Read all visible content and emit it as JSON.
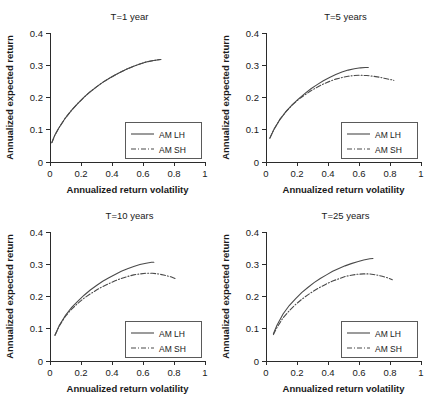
{
  "figure": {
    "layout": "2x2-grid-of-line-charts",
    "background_color": "#ffffff",
    "line_color": "#4a4a4a",
    "axis_color": "#2b2b2b"
  },
  "axis_titles": {
    "x": "Annualized return volatility",
    "y": "Annualized expected return"
  },
  "ticks": {
    "x_labels": [
      "0",
      "0.2",
      "0.4",
      "0.6",
      "0.8",
      "1"
    ],
    "x_values": [
      0,
      0.2,
      0.4,
      0.6,
      0.8,
      1
    ],
    "y_labels": [
      "0",
      "0.1",
      "0.2",
      "0.3",
      "0.4"
    ],
    "y_values": [
      0,
      0.1,
      0.2,
      0.3,
      0.4
    ]
  },
  "legend": {
    "entries": [
      {
        "label": "AM LH",
        "style": "solid"
      },
      {
        "label": "AM SH",
        "style": "dashdot"
      }
    ]
  },
  "chart_data": [
    {
      "type": "line",
      "title": "T=1 year",
      "xlabel": "Annualized return volatility",
      "ylabel": "Annualized expected return",
      "xlim": [
        0,
        1
      ],
      "ylim": [
        0,
        0.4
      ],
      "grid": false,
      "legend_position": "lower-right",
      "series": [
        {
          "name": "AM LH",
          "style": "solid",
          "x": [
            0.012,
            0.03,
            0.06,
            0.1,
            0.14,
            0.18,
            0.22,
            0.26,
            0.3,
            0.34,
            0.38,
            0.42,
            0.46,
            0.5,
            0.54,
            0.58,
            0.62,
            0.66,
            0.7,
            0.715
          ],
          "y": [
            0.06,
            0.082,
            0.108,
            0.137,
            0.161,
            0.182,
            0.201,
            0.218,
            0.233,
            0.247,
            0.259,
            0.27,
            0.28,
            0.289,
            0.297,
            0.304,
            0.31,
            0.314,
            0.317,
            0.318
          ]
        },
        {
          "name": "AM SH",
          "style": "dashdot",
          "x": [
            0.012,
            0.03,
            0.06,
            0.1,
            0.14,
            0.18,
            0.22,
            0.26,
            0.3,
            0.34,
            0.38,
            0.42,
            0.46,
            0.5,
            0.54,
            0.58,
            0.62,
            0.66,
            0.7,
            0.715
          ],
          "y": [
            0.06,
            0.082,
            0.108,
            0.137,
            0.161,
            0.182,
            0.201,
            0.218,
            0.233,
            0.247,
            0.259,
            0.27,
            0.28,
            0.289,
            0.297,
            0.304,
            0.31,
            0.314,
            0.317,
            0.318
          ]
        }
      ]
    },
    {
      "type": "line",
      "title": "T=5 years",
      "xlabel": "Annualized return volatility",
      "ylabel": "Annualized expected return",
      "xlim": [
        0,
        1
      ],
      "ylim": [
        0,
        0.4
      ],
      "grid": false,
      "legend_position": "lower-right",
      "series": [
        {
          "name": "AM LH",
          "style": "solid",
          "x": [
            0.025,
            0.05,
            0.09,
            0.13,
            0.17,
            0.21,
            0.25,
            0.29,
            0.33,
            0.37,
            0.41,
            0.45,
            0.49,
            0.53,
            0.57,
            0.61,
            0.64,
            0.66
          ],
          "y": [
            0.074,
            0.1,
            0.132,
            0.157,
            0.178,
            0.196,
            0.212,
            0.227,
            0.24,
            0.252,
            0.262,
            0.271,
            0.279,
            0.285,
            0.289,
            0.292,
            0.293,
            0.293
          ]
        },
        {
          "name": "AM SH",
          "style": "dashdot",
          "x": [
            0.025,
            0.05,
            0.09,
            0.13,
            0.17,
            0.21,
            0.25,
            0.29,
            0.33,
            0.37,
            0.41,
            0.45,
            0.49,
            0.53,
            0.57,
            0.61,
            0.65,
            0.69,
            0.73,
            0.77,
            0.81,
            0.825
          ],
          "y": [
            0.074,
            0.1,
            0.132,
            0.157,
            0.177,
            0.194,
            0.208,
            0.221,
            0.232,
            0.242,
            0.25,
            0.257,
            0.262,
            0.266,
            0.268,
            0.269,
            0.268,
            0.266,
            0.263,
            0.259,
            0.255,
            0.253
          ]
        }
      ]
    },
    {
      "type": "line",
      "title": "T=10 years",
      "xlabel": "Annualized return volatility",
      "ylabel": "Annualized expected return",
      "xlim": [
        0,
        1
      ],
      "ylim": [
        0,
        0.4
      ],
      "grid": false,
      "legend_position": "lower-right",
      "series": [
        {
          "name": "AM LH",
          "style": "solid",
          "x": [
            0.032,
            0.06,
            0.1,
            0.14,
            0.18,
            0.22,
            0.26,
            0.3,
            0.34,
            0.38,
            0.42,
            0.46,
            0.5,
            0.54,
            0.58,
            0.62,
            0.655,
            0.67
          ],
          "y": [
            0.08,
            0.11,
            0.142,
            0.166,
            0.186,
            0.204,
            0.22,
            0.234,
            0.247,
            0.258,
            0.268,
            0.278,
            0.286,
            0.293,
            0.299,
            0.303,
            0.306,
            0.306
          ]
        },
        {
          "name": "AM SH",
          "style": "dashdot",
          "x": [
            0.032,
            0.06,
            0.1,
            0.14,
            0.18,
            0.22,
            0.26,
            0.3,
            0.34,
            0.38,
            0.42,
            0.46,
            0.5,
            0.54,
            0.58,
            0.62,
            0.66,
            0.7,
            0.74,
            0.78,
            0.815
          ],
          "y": [
            0.08,
            0.109,
            0.139,
            0.161,
            0.179,
            0.195,
            0.208,
            0.22,
            0.231,
            0.24,
            0.249,
            0.256,
            0.262,
            0.267,
            0.27,
            0.272,
            0.272,
            0.27,
            0.266,
            0.261,
            0.254
          ]
        }
      ]
    },
    {
      "type": "line",
      "title": "T=25 years",
      "xlabel": "Annualized return volatility",
      "ylabel": "Annualized expected return",
      "xlim": [
        0,
        1
      ],
      "ylim": [
        0,
        0.4
      ],
      "grid": false,
      "legend_position": "lower-right",
      "series": [
        {
          "name": "AM LH",
          "style": "solid",
          "x": [
            0.048,
            0.07,
            0.11,
            0.15,
            0.19,
            0.23,
            0.27,
            0.31,
            0.35,
            0.39,
            0.43,
            0.47,
            0.51,
            0.55,
            0.59,
            0.63,
            0.67,
            0.69
          ],
          "y": [
            0.085,
            0.11,
            0.146,
            0.172,
            0.193,
            0.212,
            0.228,
            0.243,
            0.256,
            0.267,
            0.278,
            0.287,
            0.295,
            0.302,
            0.308,
            0.313,
            0.317,
            0.318
          ]
        },
        {
          "name": "AM SH",
          "style": "dashdot",
          "x": [
            0.048,
            0.07,
            0.11,
            0.15,
            0.19,
            0.23,
            0.27,
            0.31,
            0.35,
            0.39,
            0.43,
            0.47,
            0.51,
            0.55,
            0.59,
            0.63,
            0.67,
            0.71,
            0.75,
            0.79,
            0.815
          ],
          "y": [
            0.082,
            0.103,
            0.134,
            0.156,
            0.175,
            0.191,
            0.205,
            0.218,
            0.229,
            0.239,
            0.248,
            0.255,
            0.262,
            0.266,
            0.269,
            0.27,
            0.27,
            0.267,
            0.263,
            0.257,
            0.252
          ]
        }
      ]
    }
  ]
}
